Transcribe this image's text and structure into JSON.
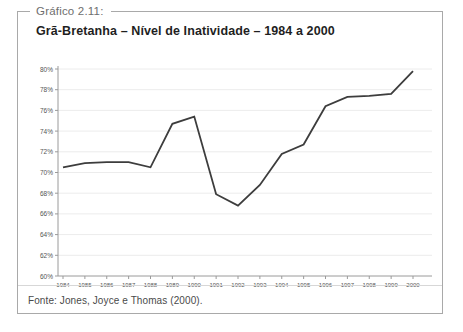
{
  "figure": {
    "label": "Gráfico 2.11:",
    "title": "Grã-Bretanha – Nível de Inatividade – 1984 a 2000",
    "source": "Fonte: Jones, Joyce e Thomas (2000)."
  },
  "chart_data": {
    "type": "line",
    "title": "Grã-Bretanha – Nível de Inatividade – 1984 a 2000",
    "x": [
      1984,
      1985,
      1986,
      1987,
      1988,
      1989,
      1990,
      1991,
      1992,
      1993,
      1994,
      1995,
      1996,
      1997,
      1998,
      1999,
      2000
    ],
    "series": [
      {
        "name": "Nível de Inatividade (%)",
        "values": [
          70.5,
          70.9,
          71.0,
          71.0,
          70.5,
          74.7,
          75.4,
          67.9,
          66.8,
          68.8,
          71.8,
          72.7,
          76.4,
          77.3,
          77.4,
          77.6,
          79.8
        ]
      }
    ],
    "xlabel": "",
    "ylabel": "",
    "ylim": [
      60,
      80
    ],
    "ytick_step": 2,
    "ytick_suffix": "%",
    "grid": true,
    "legend": "none",
    "line_color": "#3d3d3d",
    "grid_color": "#ececec",
    "axis_color": "#9a9a9a",
    "tick_label_color": "#555555"
  }
}
